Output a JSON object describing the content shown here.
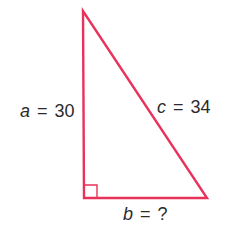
{
  "diagram": {
    "type": "right-triangle",
    "stroke_color": "#e8325a",
    "text_color": "#2b2b2b",
    "vertices": {
      "top": [
        83,
        11
      ],
      "bottom_left": [
        84,
        198
      ],
      "bottom_right": [
        207,
        198
      ]
    },
    "right_angle_marker": true,
    "labels": {
      "a": {
        "var": "a",
        "eq": "=",
        "value": "30"
      },
      "c": {
        "var": "c",
        "eq": "=",
        "value": "34"
      },
      "b": {
        "var": "b",
        "eq": "=",
        "value": "?"
      }
    }
  }
}
